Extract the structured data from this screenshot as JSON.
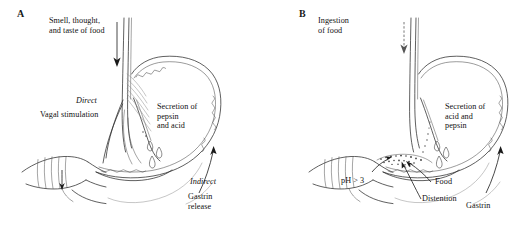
{
  "figure": {
    "background_color": "#ffffff",
    "ink_color": "#2b2b2b",
    "width": 519,
    "height": 239
  },
  "panels": [
    {
      "letter": "A",
      "phase": "cephalic",
      "labels": {
        "stimulus": "Smell, thought,\nand taste of food",
        "pathway_direct": "Direct",
        "pathway_direct_detail": "Vagal stimulation",
        "secretion": "Secretion of\npepsin\nand acid",
        "pathway_indirect": "Indirect",
        "pathway_indirect_detail": "Gastrin\nrelease"
      },
      "arrows": [
        {
          "name": "stimulus-arrow",
          "style": "solid",
          "direction": "down"
        },
        {
          "name": "gastrin-arrow",
          "style": "solid",
          "direction": "up-left"
        }
      ],
      "anatomy": [
        "esophagus",
        "stomach",
        "rugae",
        "pylorus",
        "duodenum",
        "vagus-nerve-fibers",
        "secretion-droplets"
      ]
    },
    {
      "letter": "B",
      "phase": "gastric",
      "labels": {
        "stimulus": "Ingestion\nof food",
        "ph": "pH > 3",
        "food": "Food",
        "distention": "Distention",
        "secretion": "Secretion of\nacid and\npepsin",
        "gastrin": "Gastrin"
      },
      "arrows": [
        {
          "name": "ingestion-arrow",
          "style": "dashed",
          "direction": "down"
        },
        {
          "name": "food-arrow",
          "style": "solid",
          "direction": "up-left"
        },
        {
          "name": "distention-arrow",
          "style": "solid",
          "direction": "up-left"
        },
        {
          "name": "ph-arrow",
          "style": "solid",
          "direction": "up-right"
        },
        {
          "name": "gastrin-arrow",
          "style": "solid",
          "direction": "up-left"
        }
      ],
      "anatomy": [
        "esophagus",
        "stomach",
        "rugae",
        "food-bolus",
        "pylorus",
        "duodenum",
        "secretion-droplets"
      ]
    }
  ]
}
